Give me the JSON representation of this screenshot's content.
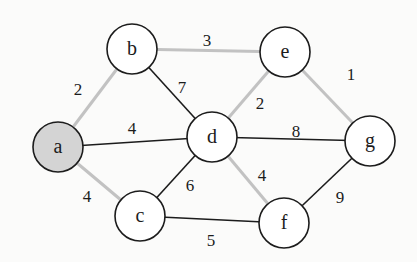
{
  "diagram": {
    "type": "weighted-undirected-graph",
    "colors": {
      "highlight_edge": "#c2c2c2",
      "normal_edge": "#1c1c1c",
      "start_node_fill": "#d4d4d4",
      "node_fill": "#ffffff"
    },
    "nodes": [
      {
        "id": "a",
        "label": "a",
        "x": 58,
        "y": 147,
        "highlighted": true
      },
      {
        "id": "b",
        "label": "b",
        "x": 132,
        "y": 49,
        "highlighted": false
      },
      {
        "id": "e",
        "label": "e",
        "x": 285,
        "y": 52,
        "highlighted": false
      },
      {
        "id": "d",
        "label": "d",
        "x": 212,
        "y": 137,
        "highlighted": false
      },
      {
        "id": "g",
        "label": "g",
        "x": 370,
        "y": 141,
        "highlighted": false
      },
      {
        "id": "c",
        "label": "c",
        "x": 140,
        "y": 216,
        "highlighted": false
      },
      {
        "id": "f",
        "label": "f",
        "x": 284,
        "y": 223,
        "highlighted": false
      }
    ],
    "edges": [
      {
        "from": "a",
        "to": "b",
        "weight": "2",
        "highlighted": true,
        "label_x": 78,
        "label_y": 89
      },
      {
        "from": "b",
        "to": "e",
        "weight": "3",
        "highlighted": true,
        "label_x": 207,
        "label_y": 40
      },
      {
        "from": "e",
        "to": "g",
        "weight": "1",
        "highlighted": true,
        "label_x": 351,
        "label_y": 74
      },
      {
        "from": "b",
        "to": "d",
        "weight": "7",
        "highlighted": false,
        "label_x": 182,
        "label_y": 87
      },
      {
        "from": "e",
        "to": "d",
        "weight": "2",
        "highlighted": true,
        "label_x": 260,
        "label_y": 103
      },
      {
        "from": "a",
        "to": "d",
        "weight": "4",
        "highlighted": false,
        "label_x": 132,
        "label_y": 128
      },
      {
        "from": "d",
        "to": "g",
        "weight": "8",
        "highlighted": false,
        "label_x": 296,
        "label_y": 131
      },
      {
        "from": "d",
        "to": "c",
        "weight": "6",
        "highlighted": false,
        "label_x": 190,
        "label_y": 185
      },
      {
        "from": "a",
        "to": "c",
        "weight": "4",
        "highlighted": true,
        "label_x": 87,
        "label_y": 196
      },
      {
        "from": "d",
        "to": "f",
        "weight": "4",
        "highlighted": true,
        "label_x": 262,
        "label_y": 175
      },
      {
        "from": "f",
        "to": "g",
        "weight": "9",
        "highlighted": false,
        "label_x": 340,
        "label_y": 197
      },
      {
        "from": "c",
        "to": "f",
        "weight": "5",
        "highlighted": false,
        "label_x": 211,
        "label_y": 240
      }
    ]
  }
}
